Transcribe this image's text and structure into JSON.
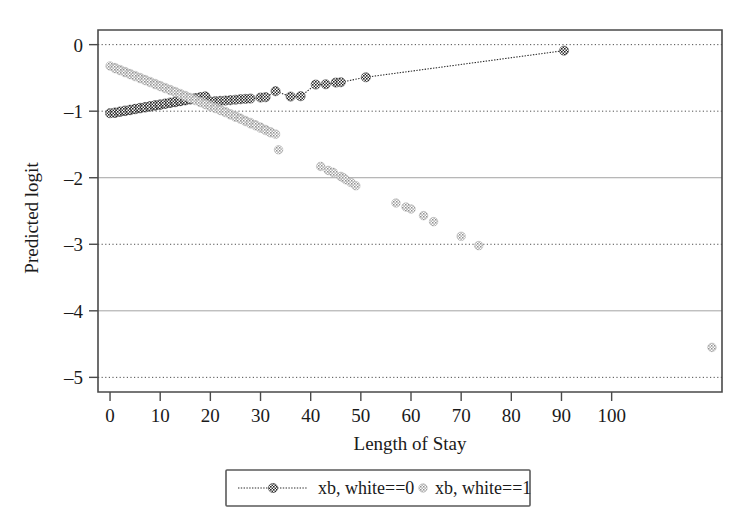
{
  "figure": {
    "background": "#ffffff",
    "plot_area": {
      "left": 98,
      "top": 30,
      "right": 722,
      "bottom": 392
    }
  },
  "chart_data": {
    "type": "scatter",
    "title": "",
    "subtitle": "",
    "xlabel": "Length of Stay",
    "ylabel": "Predicted logit",
    "xlim": [
      -2.4,
      122.0
    ],
    "ylim": [
      -5.22,
      0.22
    ],
    "xticks": [
      0,
      10,
      20,
      30,
      40,
      50,
      60,
      70,
      80,
      90,
      100
    ],
    "xticklabels": [
      "0",
      "10",
      "20",
      "30",
      "40",
      "50",
      "60",
      "70",
      "80",
      "90",
      "100"
    ],
    "yticks": [
      0,
      -1,
      -2,
      -3,
      -4,
      -5
    ],
    "yticklabels": [
      "0",
      "–1",
      "–2",
      "–3",
      "–4",
      "–5"
    ],
    "grid": true,
    "grid_axis": "y",
    "grid_style": "dotted",
    "legend_position": "below",
    "annotations": [],
    "series": [
      {
        "name": "xb, white==0",
        "legend_label": "xb, white==0",
        "marker": "circle-hatched",
        "marker_color": "#2f2f2f",
        "line": "dotted",
        "line_color": "#2b2b2b",
        "points": [
          [
            0,
            -1.03
          ],
          [
            1,
            -1.025
          ],
          [
            1,
            -1.02
          ],
          [
            2,
            -1.01
          ],
          [
            2,
            -1.005
          ],
          [
            3,
            -0.998
          ],
          [
            3,
            -0.99
          ],
          [
            4,
            -0.985
          ],
          [
            4,
            -0.978
          ],
          [
            5,
            -0.97
          ],
          [
            5,
            -0.965
          ],
          [
            6,
            -0.957
          ],
          [
            6,
            -0.95
          ],
          [
            7,
            -0.945
          ],
          [
            7,
            -0.938
          ],
          [
            8,
            -0.93
          ],
          [
            8,
            -0.925
          ],
          [
            9,
            -0.917
          ],
          [
            9,
            -0.91
          ],
          [
            10,
            -0.905
          ],
          [
            10,
            -0.898
          ],
          [
            11,
            -0.89
          ],
          [
            11,
            -0.885
          ],
          [
            12,
            -0.877
          ],
          [
            12,
            -0.87
          ],
          [
            13,
            -0.865
          ],
          [
            13,
            -0.858
          ],
          [
            14,
            -0.85
          ],
          [
            14,
            -0.845
          ],
          [
            15,
            -0.838
          ],
          [
            15,
            -0.83
          ],
          [
            16,
            -0.825
          ],
          [
            16,
            -0.818
          ],
          [
            17,
            -0.81
          ],
          [
            17,
            -0.805
          ],
          [
            18,
            -0.798
          ],
          [
            18,
            -0.79
          ],
          [
            19,
            -0.785
          ],
          [
            19,
            -0.778
          ],
          [
            20,
            -0.855
          ],
          [
            21,
            -0.85
          ],
          [
            22,
            -0.845
          ],
          [
            23,
            -0.84
          ],
          [
            24,
            -0.835
          ],
          [
            25,
            -0.828
          ],
          [
            26,
            -0.82
          ],
          [
            27,
            -0.815
          ],
          [
            28,
            -0.81
          ],
          [
            30,
            -0.795
          ],
          [
            31,
            -0.79
          ],
          [
            33,
            -0.7
          ],
          [
            36,
            -0.78
          ],
          [
            38,
            -0.775
          ],
          [
            41,
            -0.6
          ],
          [
            43,
            -0.595
          ],
          [
            45,
            -0.57
          ],
          [
            46,
            -0.565
          ],
          [
            51,
            -0.49
          ],
          [
            90.5,
            -0.09
          ]
        ]
      },
      {
        "name": "xb, white==1",
        "legend_label": "xb, white==1",
        "marker": "circle-hatched",
        "marker_color": "#9a9a9a",
        "line": "none",
        "line_color": "#9a9a9a",
        "points": [
          [
            0,
            -0.32
          ],
          [
            1,
            -0.345
          ],
          [
            1,
            -0.36
          ],
          [
            2,
            -0.375
          ],
          [
            2,
            -0.39
          ],
          [
            3,
            -0.405
          ],
          [
            3,
            -0.42
          ],
          [
            4,
            -0.435
          ],
          [
            4,
            -0.45
          ],
          [
            5,
            -0.465
          ],
          [
            5,
            -0.48
          ],
          [
            6,
            -0.495
          ],
          [
            6,
            -0.51
          ],
          [
            7,
            -0.525
          ],
          [
            7,
            -0.54
          ],
          [
            8,
            -0.555
          ],
          [
            8,
            -0.57
          ],
          [
            9,
            -0.585
          ],
          [
            9,
            -0.6
          ],
          [
            10,
            -0.615
          ],
          [
            10,
            -0.63
          ],
          [
            11,
            -0.645
          ],
          [
            11,
            -0.66
          ],
          [
            12,
            -0.675
          ],
          [
            12,
            -0.69
          ],
          [
            13,
            -0.705
          ],
          [
            13,
            -0.72
          ],
          [
            14,
            -0.735
          ],
          [
            14,
            -0.75
          ],
          [
            15,
            -0.765
          ],
          [
            15,
            -0.78
          ],
          [
            16,
            -0.795
          ],
          [
            16,
            -0.81
          ],
          [
            17,
            -0.825
          ],
          [
            17,
            -0.84
          ],
          [
            18,
            -0.855
          ],
          [
            18,
            -0.87
          ],
          [
            19,
            -0.885
          ],
          [
            19,
            -0.9
          ],
          [
            20,
            -0.915
          ],
          [
            20,
            -0.93
          ],
          [
            21,
            -0.945
          ],
          [
            21,
            -0.96
          ],
          [
            22,
            -0.975
          ],
          [
            22,
            -0.99
          ],
          [
            23,
            -1.005
          ],
          [
            23,
            -1.02
          ],
          [
            24,
            -1.04
          ],
          [
            24,
            -1.055
          ],
          [
            25,
            -1.07
          ],
          [
            25,
            -1.09
          ],
          [
            26,
            -1.105
          ],
          [
            26,
            -1.12
          ],
          [
            27,
            -1.14
          ],
          [
            27,
            -1.155
          ],
          [
            28,
            -1.17
          ],
          [
            28,
            -1.19
          ],
          [
            29,
            -1.205
          ],
          [
            29,
            -1.22
          ],
          [
            30,
            -1.24
          ],
          [
            30,
            -1.255
          ],
          [
            31,
            -1.275
          ],
          [
            31,
            -1.29
          ],
          [
            32,
            -1.31
          ],
          [
            32,
            -1.325
          ],
          [
            33,
            -1.345
          ],
          [
            33.6,
            -1.58
          ],
          [
            42,
            -1.83
          ],
          [
            43.5,
            -1.89
          ],
          [
            44.5,
            -1.92
          ],
          [
            46,
            -1.98
          ],
          [
            46.5,
            -2.0
          ],
          [
            47,
            -2.03
          ],
          [
            48,
            -2.07
          ],
          [
            49,
            -2.12
          ],
          [
            57,
            -2.38
          ],
          [
            59,
            -2.44
          ],
          [
            60,
            -2.47
          ],
          [
            62.5,
            -2.57
          ],
          [
            64.5,
            -2.66
          ],
          [
            70,
            -2.88
          ],
          [
            73.5,
            -3.02
          ],
          [
            120,
            -4.55
          ]
        ]
      }
    ]
  },
  "axes": {
    "y_title": "Predicted logit",
    "x_title": "Length of Stay"
  },
  "legend": {
    "entries": [
      {
        "label": "xb, white==0",
        "style": "line-with-marker",
        "color": "#2f2f2f"
      },
      {
        "label": "xb, white==1",
        "style": "marker-only",
        "color": "#9a9a9a"
      }
    ]
  }
}
